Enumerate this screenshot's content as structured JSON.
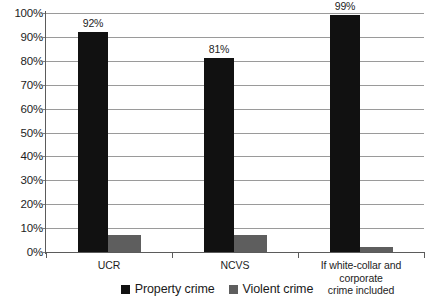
{
  "chart_data": {
    "type": "bar",
    "title": "",
    "subtitle": "",
    "xlabel": "",
    "ylabel": "",
    "ylim": [
      0,
      100
    ],
    "grid": true,
    "legend_position": "bottom",
    "categories": [
      "UCR",
      "NCVS",
      "If white-collar and corporate crime included"
    ],
    "category_lines": [
      [
        "UCR"
      ],
      [
        "NCVS"
      ],
      [
        "If white-collar and corporate",
        "crime included"
      ]
    ],
    "series": [
      {
        "name": "Property crime",
        "color": "#111111",
        "values": [
          92,
          81,
          99
        ],
        "labels": [
          "92%",
          "81%",
          "99%"
        ]
      },
      {
        "name": "Violent crime",
        "color": "#5e5e5e",
        "values": [
          7,
          7,
          2
        ],
        "labels": [
          "",
          "",
          ""
        ]
      }
    ],
    "ytick_labels": [
      "100%",
      "90%",
      "80%",
      "70%",
      "60%",
      "50%",
      "40%",
      "30%",
      "20%",
      "10%",
      "0%"
    ],
    "ytick_values": [
      100,
      90,
      80,
      70,
      60,
      50,
      40,
      30,
      20,
      10,
      0
    ]
  },
  "legend": {
    "items": [
      {
        "label": "Property crime",
        "color": "#111111"
      },
      {
        "label": "Violent crime",
        "color": "#5e5e5e"
      }
    ]
  }
}
